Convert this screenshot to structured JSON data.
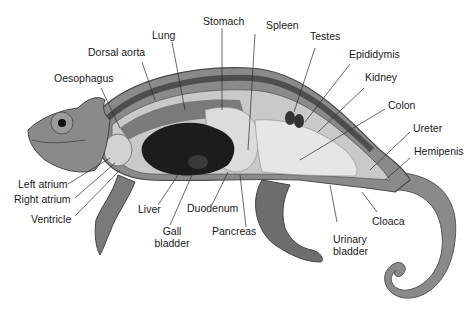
{
  "diagram": {
    "colors": {
      "background": "#ffffff",
      "skin": "#8a8a8a",
      "skin_dark": "#5e5e5e",
      "body_cavity": "#c9c9c9",
      "liver": "#1c1c1c",
      "lung": "#7a7a7a",
      "stomach": "#d8d8d8",
      "intestine": "#e6e6e6",
      "text": "#1a1a1a",
      "leader_line": "#2a2a2a"
    },
    "labels": {
      "stomach": "Stomach",
      "lung": "Lung",
      "spleen": "Spleen",
      "testes": "Testes",
      "dorsal_aorta": "Dorsal aorta",
      "epididymis": "Epididymis",
      "oesophagus": "Oesophagus",
      "kidney": "Kidney",
      "colon": "Colon",
      "ureter": "Ureter",
      "hemipenis": "Hemipenis",
      "left_atrium": "Left atrium",
      "right_atrium": "Right atrium",
      "ventricle": "Ventricle",
      "liver": "Liver",
      "gall_bladder_1": "Gall",
      "gall_bladder_2": "bladder",
      "duodenum": "Duodenum",
      "pancreas": "Pancreas",
      "urinary_bladder_1": "Urinary",
      "urinary_bladder_2": "bladder",
      "cloaca": "Cloaca"
    }
  }
}
